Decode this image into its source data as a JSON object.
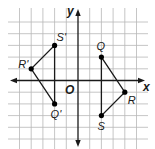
{
  "diagram": {
    "type": "coordinate-plane-rotation",
    "axes": {
      "x_label": "x",
      "y_label": "y",
      "origin_label": "O",
      "x_range": [
        -5,
        5
      ],
      "y_range": [
        -5,
        5
      ],
      "grid_step": 1
    },
    "figures": [
      {
        "name": "QRS",
        "vertices": [
          {
            "label": "Q",
            "x": 2,
            "y": 2
          },
          {
            "label": "R",
            "x": 4,
            "y": -1
          },
          {
            "label": "S",
            "x": 2,
            "y": -3
          }
        ]
      },
      {
        "name": "Q'R'S'",
        "vertices": [
          {
            "label": "Q'",
            "x": -2,
            "y": -2
          },
          {
            "label": "R'",
            "x": -4,
            "y": 1
          },
          {
            "label": "S'",
            "x": -2,
            "y": 3
          }
        ]
      }
    ],
    "colors": {
      "grid": "#b8b8b8",
      "ink": "#1a1a1a",
      "background": "#ffffff"
    }
  }
}
